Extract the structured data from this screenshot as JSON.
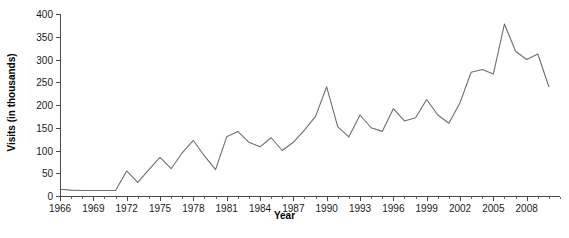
{
  "chart_data": {
    "type": "line",
    "title": "",
    "xlabel": "Year",
    "ylabel": "Visits (in thousands)",
    "xlim": [
      1966,
      2011
    ],
    "ylim": [
      0,
      400
    ],
    "grid": false,
    "legend_position": "none",
    "y_ticks": [
      0,
      50,
      100,
      150,
      200,
      250,
      300,
      350,
      400
    ],
    "y_tick_labels": [
      "0",
      "50",
      "100",
      "150",
      "200",
      "250",
      "300",
      "350",
      "400"
    ],
    "x_ticks": [
      1966,
      1969,
      1972,
      1975,
      1978,
      1981,
      1984,
      1987,
      1990,
      1993,
      1996,
      1999,
      2002,
      2005,
      2008
    ],
    "x_tick_labels": [
      "1966",
      "1969",
      "1972",
      "1975",
      "1978",
      "1981",
      "1984",
      "1987",
      "1990",
      "1993",
      "1996",
      "1999",
      "2002",
      "2005",
      "2008"
    ],
    "x_minor_tick_step": 1,
    "line_color": "#6e6e6e",
    "axis_color": "#4a4a4a",
    "x": [
      1966,
      1967,
      1968,
      1969,
      1970,
      1971,
      1972,
      1973,
      1974,
      1975,
      1976,
      1977,
      1978,
      1979,
      1980,
      1981,
      1982,
      1983,
      1984,
      1985,
      1986,
      1987,
      1988,
      1989,
      1990,
      1991,
      1992,
      1993,
      1994,
      1995,
      1996,
      1997,
      1998,
      1999,
      2000,
      2001,
      2002,
      2003,
      2004,
      2005,
      2006,
      2007,
      2008,
      2009,
      2010
    ],
    "values": [
      15,
      13,
      12,
      12,
      12,
      12,
      55,
      30,
      58,
      85,
      60,
      95,
      122,
      88,
      58,
      130,
      142,
      118,
      108,
      128,
      100,
      118,
      145,
      175,
      240,
      152,
      130,
      178,
      150,
      142,
      192,
      165,
      172,
      212,
      178,
      160,
      205,
      272,
      278,
      268,
      378,
      318,
      300,
      312,
      240
    ],
    "series": [
      {
        "name": "Visits",
        "values": [
          15,
          13,
          12,
          12,
          12,
          12,
          55,
          30,
          58,
          85,
          60,
          95,
          122,
          88,
          58,
          130,
          142,
          118,
          108,
          128,
          100,
          118,
          145,
          175,
          240,
          152,
          130,
          178,
          150,
          142,
          192,
          165,
          172,
          212,
          178,
          160,
          205,
          272,
          278,
          268,
          378,
          318,
          300,
          312,
          240
        ]
      }
    ]
  },
  "caption": ""
}
